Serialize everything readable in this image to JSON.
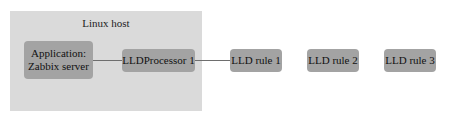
{
  "diagram": {
    "container": {
      "label": "Linux host"
    },
    "nodes": [
      {
        "id": "app",
        "lines": [
          "Application:",
          "Zabbix server"
        ]
      },
      {
        "id": "proc",
        "label": "LLDProcessor 1"
      },
      {
        "id": "rule1",
        "label": "LLD rule 1"
      },
      {
        "id": "rule2",
        "label": "LLD rule 2"
      },
      {
        "id": "rule3",
        "label": "LLD rule 3"
      }
    ],
    "edges": [
      {
        "from": "app",
        "to": "proc"
      },
      {
        "from": "proc",
        "to": "rule1"
      }
    ],
    "colors": {
      "container_bg": "#dadada",
      "node_bg": "#a3a3a3",
      "edge": "#6e6e6e"
    }
  }
}
